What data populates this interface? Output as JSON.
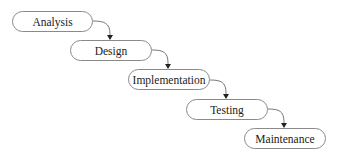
{
  "diagram": {
    "type": "waterfall",
    "colors": {
      "border": "#8a8a8a",
      "text": "#222222",
      "arrow": "#333333",
      "background": "#ffffff"
    },
    "nodes": [
      {
        "id": "analysis",
        "label": "Analysis",
        "x": 12,
        "y": 11,
        "w": 81,
        "h": 21
      },
      {
        "id": "design",
        "label": "Design",
        "x": 70,
        "y": 40,
        "w": 82,
        "h": 21
      },
      {
        "id": "implementation",
        "label": "Implementation",
        "x": 128,
        "y": 69,
        "w": 82,
        "h": 21
      },
      {
        "id": "testing",
        "label": "Testing",
        "x": 186,
        "y": 99,
        "w": 82,
        "h": 21
      },
      {
        "id": "maintenance",
        "label": "Maintenance",
        "x": 244,
        "y": 128,
        "w": 82,
        "h": 21
      }
    ],
    "edges": [
      {
        "from": "analysis",
        "to": "design"
      },
      {
        "from": "design",
        "to": "implementation"
      },
      {
        "from": "implementation",
        "to": "testing"
      },
      {
        "from": "testing",
        "to": "maintenance"
      }
    ]
  }
}
